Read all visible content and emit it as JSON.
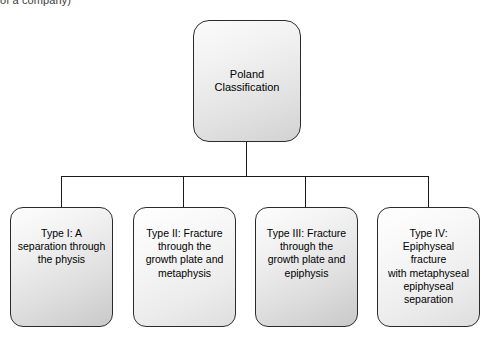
{
  "caption": {
    "partial_text": "of a company)"
  },
  "diagram": {
    "type": "tree",
    "root": {
      "label": "Poland\nClassification"
    },
    "children": [
      {
        "label": "Type I: A\nseparation through\nthe physis"
      },
      {
        "label": "Type II: Fracture\nthrough the\ngrowth plate and\nmetaphysis"
      },
      {
        "label": "Type III: Fracture\nthrough the\ngrowth plate and\nepiphysis"
      },
      {
        "label": "Type IV:\nEpiphyseal\nfracture\nwith metaphyseal\nepiphyseal\nseparation"
      }
    ],
    "colors": {
      "border": "#2b2b2b",
      "connector": "#1a1a1a",
      "fill_light": "#fdfdfd",
      "fill_dark": "#c9c9c9",
      "background": "#ffffff",
      "text": "#000000"
    }
  }
}
